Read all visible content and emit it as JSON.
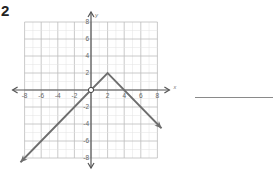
{
  "problem": {
    "number": "2"
  },
  "chart_data": {
    "type": "line",
    "title": "",
    "xlabel": "x",
    "ylabel": "y",
    "xlim": [
      -8,
      8
    ],
    "ylim": [
      -8,
      8
    ],
    "grid": true,
    "x_ticks": [
      "-8",
      "-6",
      "-4",
      "-2",
      "2",
      "4",
      "6",
      "8"
    ],
    "y_ticks": [
      "8",
      "6",
      "4",
      "2",
      "-2",
      "-4",
      "-6",
      "-8"
    ],
    "series": [
      {
        "name": "piecewise",
        "points": [
          [
            -8.5,
            -8.5
          ],
          [
            0,
            0
          ],
          [
            2,
            2
          ],
          [
            8.5,
            -4.5
          ]
        ],
        "arrows": [
          "start",
          "end"
        ],
        "open_circle": [
          0,
          0
        ],
        "vertex": [
          2,
          2
        ]
      }
    ],
    "colors": {
      "line": "#6e6e6e",
      "grid_major": "#bdbdbd",
      "grid_minor": "#e2e2e2",
      "axis": "#555555"
    }
  },
  "answer": {
    "line_value": ""
  }
}
